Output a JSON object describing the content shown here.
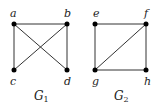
{
  "graphs": [
    {
      "name": "G",
      "subscript": "1",
      "vertices": [
        {
          "id": "a",
          "x": 14,
          "y": 24
        },
        {
          "id": "b",
          "x": 67,
          "y": 24
        },
        {
          "id": "c",
          "x": 14,
          "y": 70
        },
        {
          "id": "d",
          "x": 67,
          "y": 70
        }
      ],
      "edges": [
        [
          "a",
          "b"
        ],
        [
          "a",
          "c"
        ],
        [
          "a",
          "d"
        ],
        [
          "b",
          "c"
        ],
        [
          "b",
          "d"
        ]
      ]
    },
    {
      "name": "G",
      "subscript": "2",
      "vertices": [
        {
          "id": "e",
          "x": 95,
          "y": 24
        },
        {
          "id": "f",
          "x": 146,
          "y": 24
        },
        {
          "id": "g",
          "x": 95,
          "y": 70
        },
        {
          "id": "h",
          "x": 146,
          "y": 70
        }
      ],
      "edges": [
        [
          "e",
          "f"
        ],
        [
          "e",
          "g"
        ],
        [
          "f",
          "g"
        ],
        [
          "f",
          "h"
        ],
        [
          "g",
          "h"
        ]
      ]
    }
  ],
  "labels": {
    "a": "a",
    "b": "b",
    "c": "c",
    "d": "d",
    "e": "e",
    "f": "f",
    "g": "g",
    "h": "h",
    "g1_name": "G",
    "g1_sub": "1",
    "g2_name": "G",
    "g2_sub": "2"
  }
}
